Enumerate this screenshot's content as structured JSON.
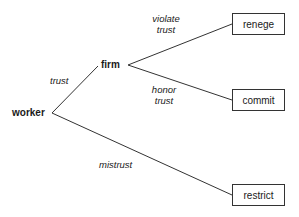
{
  "diagram": {
    "type": "game-tree",
    "nodes": {
      "worker": "worker",
      "firm": "firm"
    },
    "edges": {
      "trust": "trust",
      "mistrust": "mistrust",
      "violate_trust_line1": "violate",
      "violate_trust_line2": "trust",
      "honor_trust_line1": "honor",
      "honor_trust_line2": "trust"
    },
    "outcomes": {
      "renege": "renege",
      "commit": "commit",
      "restrict": "restrict"
    },
    "colors": {
      "line": "#333333",
      "text": "#1a1a1a",
      "background": "#ffffff"
    }
  }
}
